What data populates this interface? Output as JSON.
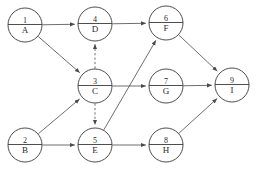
{
  "diagram": {
    "type": "directed-graph",
    "colors": {
      "background": "#ffffff",
      "node_stroke": "#3a3a3a",
      "node_fill": "#ffffff",
      "edge_stroke": "#4a4a4a",
      "text": "#2b2b2b"
    },
    "node_radius": 17,
    "nodes": [
      {
        "key": "A",
        "id": "1",
        "label": "A",
        "cx": 25,
        "cy": 25
      },
      {
        "key": "B",
        "id": "2",
        "label": "B",
        "cx": 25,
        "cy": 145
      },
      {
        "key": "C",
        "id": "3",
        "label": "C",
        "cx": 95,
        "cy": 86
      },
      {
        "key": "D",
        "id": "4",
        "label": "D",
        "cx": 95,
        "cy": 24
      },
      {
        "key": "E",
        "id": "5",
        "label": "E",
        "cx": 95,
        "cy": 145
      },
      {
        "key": "F",
        "id": "6",
        "label": "F",
        "cx": 166,
        "cy": 23
      },
      {
        "key": "G",
        "id": "7",
        "label": "G",
        "cx": 166,
        "cy": 86
      },
      {
        "key": "H",
        "id": "8",
        "label": "H",
        "cx": 166,
        "cy": 145
      },
      {
        "key": "I",
        "id": "9",
        "label": "I",
        "cx": 232,
        "cy": 85
      }
    ],
    "edges": [
      {
        "from": "A",
        "to": "D",
        "style": "solid",
        "name": "edge-a-to-d"
      },
      {
        "from": "A",
        "to": "C",
        "style": "solid",
        "name": "edge-a-to-c"
      },
      {
        "from": "B",
        "to": "C",
        "style": "solid",
        "name": "edge-b-to-c"
      },
      {
        "from": "B",
        "to": "E",
        "style": "solid",
        "name": "edge-b-to-e"
      },
      {
        "from": "C",
        "to": "D",
        "style": "dashed",
        "name": "edge-c-to-d-dummy"
      },
      {
        "from": "C",
        "to": "E",
        "style": "dashed",
        "name": "edge-c-to-e-dummy"
      },
      {
        "from": "C",
        "to": "G",
        "style": "solid",
        "name": "edge-c-to-g"
      },
      {
        "from": "D",
        "to": "F",
        "style": "solid",
        "name": "edge-d-to-f"
      },
      {
        "from": "E",
        "to": "F",
        "style": "solid",
        "name": "edge-e-to-f"
      },
      {
        "from": "E",
        "to": "H",
        "style": "solid",
        "name": "edge-e-to-h"
      },
      {
        "from": "F",
        "to": "I",
        "style": "solid",
        "name": "edge-f-to-i"
      },
      {
        "from": "G",
        "to": "I",
        "style": "solid",
        "name": "edge-g-to-i"
      },
      {
        "from": "H",
        "to": "I",
        "style": "solid",
        "name": "edge-h-to-i"
      }
    ]
  }
}
